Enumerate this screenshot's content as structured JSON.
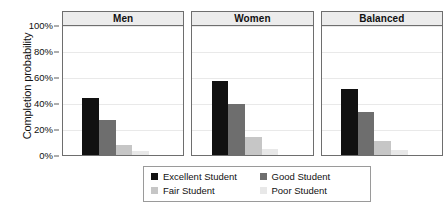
{
  "chart_data": {
    "type": "bar",
    "title": "",
    "xlabel": "",
    "ylabel": "Completion probability",
    "ylim": [
      0,
      100
    ],
    "ytick_labels": [
      "100%",
      "80%",
      "60%",
      "40%",
      "20%",
      "0%"
    ],
    "ytick_values": [
      100,
      80,
      60,
      40,
      20,
      0
    ],
    "grid": true,
    "legend_position": "bottom",
    "panels": [
      "Men",
      "Women",
      "Balanced"
    ],
    "categories": [
      "Excellent Student",
      "Good Student",
      "Fair Student",
      "Poor Student"
    ],
    "series": [
      {
        "name": "Men",
        "values": [
          44,
          27,
          8,
          3
        ]
      },
      {
        "name": "Women",
        "values": [
          57,
          39,
          14,
          5
        ]
      },
      {
        "name": "Balanced",
        "values": [
          51,
          33,
          11,
          4
        ]
      }
    ],
    "colors": {
      "excellent_student": "#111111",
      "good_student": "#6e6e6e",
      "fair_student": "#c6c6c6",
      "poor_student": "#e8e8e8",
      "panel_strip": "#ececec",
      "panel_border": "#6e6e6e",
      "gridline": "#e9e9e9"
    }
  },
  "legend": {
    "items": [
      {
        "label": "Excellent Student",
        "color": "#111111"
      },
      {
        "label": "Good Student",
        "color": "#6e6e6e"
      },
      {
        "label": "Fair Student",
        "color": "#c6c6c6"
      },
      {
        "label": "Poor Student",
        "color": "#e8e8e8"
      }
    ]
  }
}
